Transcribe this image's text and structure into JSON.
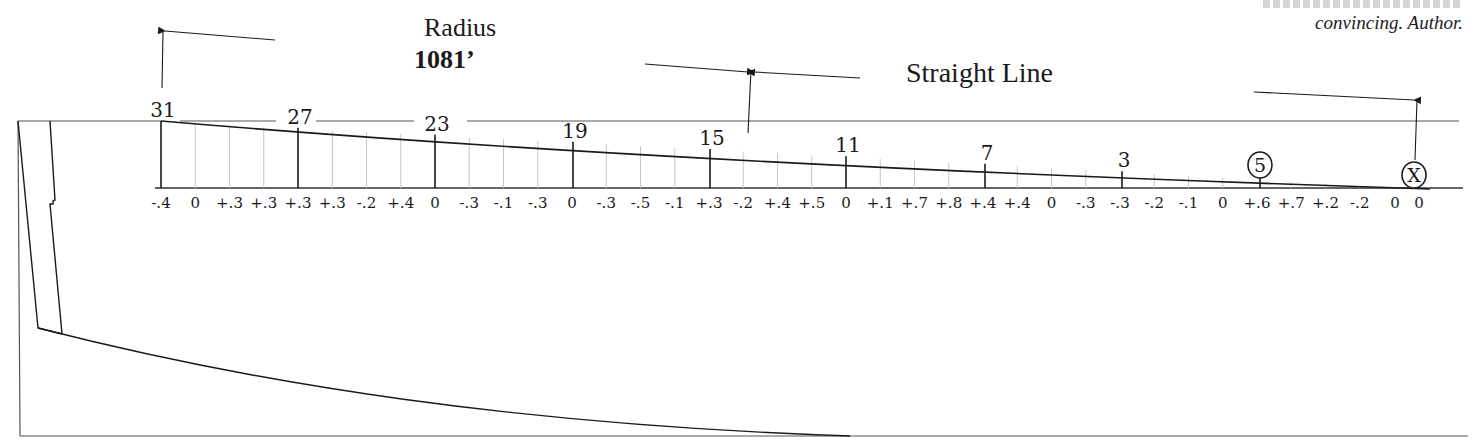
{
  "labels": {
    "radius_title": "Radius",
    "radius_value": "1081’",
    "straight_line": "Straight Line",
    "caption_visible_line": "convincing. Author."
  },
  "colors": {
    "ink": "#1a1a1a",
    "fine_grid": "#c8c8c8",
    "reference_line": "#555555",
    "background": "#ffffff"
  },
  "stations": [
    {
      "label": "31",
      "x": 161,
      "circled": false
    },
    {
      "label": "27",
      "x": 298,
      "circled": false
    },
    {
      "label": "23",
      "x": 435,
      "circled": false
    },
    {
      "label": "19",
      "x": 573,
      "circled": false
    },
    {
      "label": "15",
      "x": 710,
      "circled": false
    },
    {
      "label": "11",
      "x": 846,
      "circled": false
    },
    {
      "label": "7",
      "x": 985,
      "circled": false
    },
    {
      "label": "3",
      "x": 1122,
      "circled": false
    },
    {
      "label": "5",
      "x": 1260,
      "circled": true
    },
    {
      "label": "X",
      "x": 1414,
      "circled": true
    }
  ],
  "offsets": [
    "-.4",
    "0",
    "+.3",
    "+.3",
    "+.3",
    "+.3",
    "-.2",
    "+.4",
    "0",
    "-.3",
    "-.1",
    "-.3",
    "0",
    "-.3",
    "-.5",
    "-.1",
    "+.3",
    "-.2",
    "+.4",
    "+.5",
    "0",
    "+.1",
    "+.7",
    "+.8",
    "+.4",
    "+.4",
    "0",
    "-.3",
    "-.3",
    "-.2",
    "-.1",
    "0",
    "+.6",
    "+.7",
    "+.2",
    "-.2",
    "0",
    "0"
  ],
  "chart_data": {
    "type": "line",
    "annotations": [
      "Radius 1081’",
      "Straight Line"
    ],
    "stations_major": [
      "31",
      "27",
      "23",
      "19",
      "15",
      "11",
      "7",
      "3",
      "5",
      "X"
    ],
    "offset_labels": [
      "-.4",
      "0",
      "+.3",
      "+.3",
      "+.3",
      "+.3",
      "-.2",
      "+.4",
      "0",
      "-.3",
      "-.1",
      "-.3",
      "0",
      "-.3",
      "-.5",
      "-.1",
      "+.3",
      "-.2",
      "+.4",
      "+.5",
      "0",
      "+.1",
      "+.7",
      "+.8",
      "+.4",
      "+.4",
      "0",
      "-.3",
      "-.3",
      "-.2",
      "-.1",
      "0",
      "+.6",
      "+.7",
      "+.2",
      "-.2",
      "0",
      "0"
    ],
    "grid": true
  }
}
